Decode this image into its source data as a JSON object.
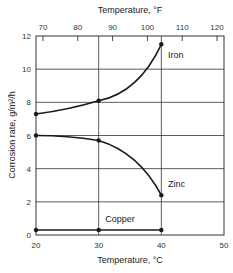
{
  "chart_data": {
    "type": "line",
    "title": "",
    "xlabel": "Temperature, °C",
    "x2label": "Temperature, °F",
    "ylabel": "Corrosion rate, g/m²/h",
    "xlim": [
      20,
      50
    ],
    "ylim": [
      0,
      12
    ],
    "x_ticks": [
      20,
      30,
      40,
      50
    ],
    "x_tick_labels": [
      "20",
      "30",
      "40",
      "50"
    ],
    "x2_ticks_f": [
      70,
      80,
      90,
      100,
      110,
      120
    ],
    "x2_tick_labels": [
      "70",
      "80",
      "90",
      "100",
      "110",
      "120"
    ],
    "y_ticks": [
      0,
      2,
      4,
      6,
      8,
      10,
      12
    ],
    "y_tick_labels": [
      "0",
      "2",
      "4",
      "6",
      "8",
      "10",
      "12"
    ],
    "grid": true,
    "legend": "inline labels",
    "series": [
      {
        "name": "Iron",
        "x": [
          20,
          30,
          40
        ],
        "values": [
          7.3,
          8.1,
          11.5
        ]
      },
      {
        "name": "Zinc",
        "x": [
          20,
          30,
          40
        ],
        "values": [
          6.0,
          5.7,
          2.4
        ]
      },
      {
        "name": "Copper",
        "x": [
          20,
          30,
          40
        ],
        "values": [
          0.3,
          0.3,
          0.3
        ]
      }
    ]
  },
  "labels": {
    "x_title": "Temperature, °C",
    "x2_title": "Temperature, °F",
    "y_title": "Corrosion rate, g/m²/h",
    "iron": "Iron",
    "zinc": "Zinc",
    "copper": "Copper"
  },
  "colors": {
    "line": "#1a1a1a",
    "grid": "#333333",
    "background": "#ffffff"
  }
}
